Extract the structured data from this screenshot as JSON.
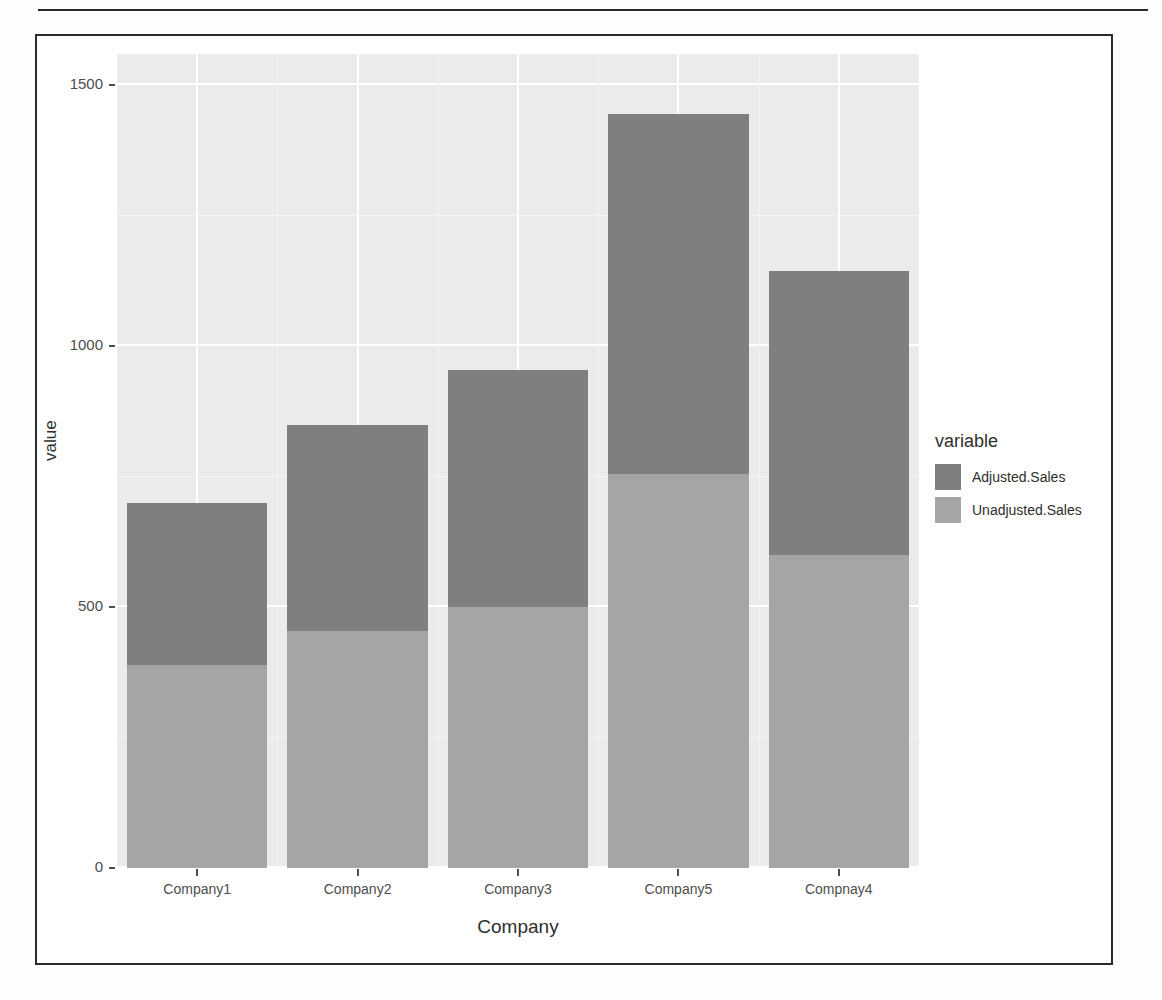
{
  "chart_data": {
    "type": "bar",
    "subtype": "stacked",
    "title": "",
    "xlabel": "Company",
    "ylabel": "value",
    "categories": [
      "Company1",
      "Company2",
      "Company3",
      "Company5",
      "Compnay4"
    ],
    "series": [
      {
        "name": "Unadjusted.Sales",
        "color": "#a5a5a5",
        "values": [
          390,
          455,
          500,
          755,
          600
        ]
      },
      {
        "name": "Adjusted.Sales",
        "color": "#7f7f7f",
        "values": [
          310,
          395,
          455,
          690,
          545
        ]
      }
    ],
    "stack_totals": [
      700,
      850,
      955,
      1445,
      1145
    ],
    "ylim": [
      0,
      1560
    ],
    "y_ticks": [
      0,
      500,
      1000,
      1500
    ],
    "y_tick_labels": [
      "0",
      "500",
      "1000",
      "1500"
    ],
    "y_minor_ticks": [
      250,
      750,
      1250
    ],
    "grid": true,
    "legend": {
      "title": "variable",
      "position": "right",
      "entries": [
        {
          "label": "Adjusted.Sales",
          "color": "#7f7f7f"
        },
        {
          "label": "Unadjusted.Sales",
          "color": "#a5a5a5"
        }
      ]
    },
    "panel_background": "#ebebeb",
    "gridline_color": "#ffffff"
  },
  "figure": {
    "frame_color": "#2b2b2b",
    "ghost_text": "some of the scanned page text bleeds through from the reverse side"
  }
}
